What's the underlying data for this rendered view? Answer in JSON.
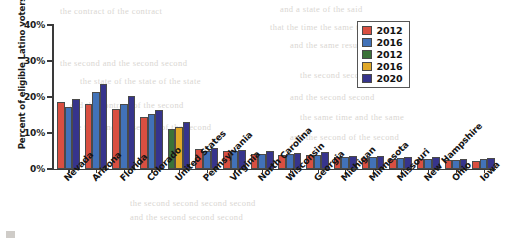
{
  "chart_data": {
    "type": "bar",
    "title": "",
    "subtitle": "",
    "xlabel": "",
    "ylabel": "Percent of eligible Latino voters",
    "ylim": [
      0,
      40
    ],
    "yticks": [
      "0%",
      "10%",
      "20%",
      "30%",
      "40%"
    ],
    "ytick_values": [
      0,
      10,
      20,
      30,
      40
    ],
    "grid": false,
    "legend_position": "top-right",
    "categories": [
      "Nevada",
      "Arizona",
      "Florida",
      "Colorado",
      "United States",
      "Pennsylvania",
      "Virginia",
      "North Carolina",
      "Wisconsin",
      "Georgia",
      "Michigan",
      "Minnesota",
      "Missouri",
      "New Hampshire",
      "Ohio",
      "Iowa"
    ],
    "series": [
      {
        "name": "2012",
        "color": "#d94f41",
        "values": [
          18.6,
          18.0,
          16.8,
          14.5,
          null,
          5.6,
          4.9,
          4.2,
          4.0,
          3.9,
          3.2,
          3.1,
          2.9,
          2.8,
          2.5,
          2.2
        ]
      },
      {
        "name": "2016",
        "color": "#4272b8",
        "values": [
          17.2,
          21.4,
          18.0,
          15.3,
          null,
          5.0,
          5.1,
          4.3,
          4.1,
          4.0,
          3.3,
          3.2,
          3.0,
          2.9,
          2.6,
          2.7
        ]
      },
      {
        "name": "2012",
        "color": "#3b7238",
        "values": [
          null,
          null,
          null,
          null,
          11.0,
          null,
          null,
          null,
          null,
          null,
          null,
          null,
          null,
          null,
          null,
          null
        ]
      },
      {
        "name": "2016",
        "color": "#e0a828",
        "values": [
          null,
          null,
          null,
          null,
          11.6,
          null,
          null,
          null,
          null,
          null,
          null,
          null,
          null,
          null,
          null,
          null
        ]
      },
      {
        "name": "2020",
        "color": "#36348c",
        "values": [
          19.4,
          23.5,
          20.4,
          16.5,
          13.0,
          5.9,
          5.4,
          4.9,
          4.4,
          4.6,
          3.6,
          3.5,
          3.3,
          3.2,
          2.9,
          3.0
        ]
      }
    ],
    "legend": [
      {
        "label": "2012",
        "color": "#d94f41"
      },
      {
        "label": "2016",
        "color": "#4272b8"
      },
      {
        "label": "2012",
        "color": "#3b7238"
      },
      {
        "label": "2016",
        "color": "#e0a828"
      },
      {
        "label": "2020",
        "color": "#36348c"
      }
    ]
  },
  "bleed_text": [
    {
      "text": "the contract of the contract",
      "x": 60,
      "y": 6
    },
    {
      "text": "and a state of the said",
      "x": 280,
      "y": 4
    },
    {
      "text": "that the time the same time",
      "x": 270,
      "y": 22
    },
    {
      "text": "and the same result of",
      "x": 290,
      "y": 40
    },
    {
      "text": "the second and the second second",
      "x": 60,
      "y": 58
    },
    {
      "text": "the state of the state of the state",
      "x": 80,
      "y": 76
    },
    {
      "text": "the second second second",
      "x": 300,
      "y": 70
    },
    {
      "text": "and the second second",
      "x": 290,
      "y": 92
    },
    {
      "text": "and the contract of the second",
      "x": 70,
      "y": 100
    },
    {
      "text": "the same time and the same",
      "x": 300,
      "y": 112
    },
    {
      "text": "the first and the second of the second",
      "x": 70,
      "y": 122
    },
    {
      "text": "and the second of the second",
      "x": 290,
      "y": 132
    },
    {
      "text": "the second second second second",
      "x": 130,
      "y": 198
    },
    {
      "text": "and the second second second",
      "x": 130,
      "y": 212
    }
  ]
}
